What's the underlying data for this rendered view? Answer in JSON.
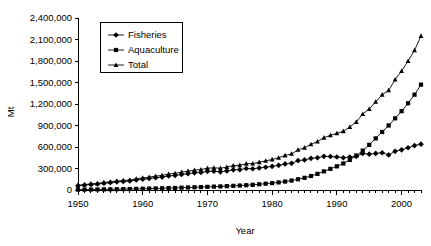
{
  "chart_data": {
    "type": "line",
    "title": "",
    "xlabel": "Year",
    "ylabel": "Mt",
    "xlim": [
      1950,
      2003
    ],
    "ylim": [
      0,
      2400000
    ],
    "grid": false,
    "legend_position": "top-left",
    "x_tick_labels": [
      "1950",
      "1960",
      "1970",
      "1980",
      "1990",
      "2000"
    ],
    "x_ticks": [
      1950,
      1960,
      1970,
      1980,
      1990,
      2000
    ],
    "y_tick_labels": [
      "0",
      "300,000",
      "600,000",
      "900,000",
      "1,200,000",
      "1,500,000",
      "1,800,000",
      "2,100,000",
      "2,400,000"
    ],
    "y_ticks": [
      0,
      300000,
      600000,
      900000,
      1200000,
      1500000,
      1800000,
      2100000,
      2400000
    ],
    "x": [
      1950,
      1951,
      1952,
      1953,
      1954,
      1955,
      1956,
      1957,
      1958,
      1959,
      1960,
      1961,
      1962,
      1963,
      1964,
      1965,
      1966,
      1967,
      1968,
      1969,
      1970,
      1971,
      1972,
      1973,
      1974,
      1975,
      1976,
      1977,
      1978,
      1979,
      1980,
      1981,
      1982,
      1983,
      1984,
      1985,
      1986,
      1987,
      1988,
      1989,
      1990,
      1991,
      1992,
      1993,
      1994,
      1995,
      1996,
      1997,
      1998,
      1999,
      2000,
      2001,
      2002,
      2003
    ],
    "series": [
      {
        "name": "Fisheries",
        "marker": "diamond",
        "values": [
          60000,
          70000,
          78000,
          84000,
          95000,
          104000,
          114000,
          120000,
          126000,
          140000,
          150000,
          160000,
          172000,
          180000,
          196000,
          204000,
          216000,
          228000,
          240000,
          244000,
          260000,
          262000,
          254000,
          266000,
          282000,
          284000,
          300000,
          296000,
          308000,
          318000,
          330000,
          344000,
          364000,
          372000,
          410000,
          420000,
          442000,
          450000,
          470000,
          468000,
          460000,
          450000,
          460000,
          470000,
          510000,
          500000,
          510000,
          520000,
          490000,
          540000,
          560000,
          590000,
          620000,
          640000
        ]
      },
      {
        "name": "Aquaculture",
        "marker": "square",
        "values": [
          5000,
          6000,
          7000,
          8000,
          9000,
          10000,
          11000,
          13000,
          14000,
          16000,
          18000,
          20000,
          22000,
          24000,
          27000,
          29000,
          32000,
          35000,
          38000,
          41000,
          44000,
          47000,
          50000,
          54000,
          58000,
          62000,
          67000,
          72000,
          80000,
          88000,
          96000,
          106000,
          118000,
          132000,
          150000,
          170000,
          195000,
          225000,
          260000,
          295000,
          330000,
          370000,
          420000,
          480000,
          550000,
          630000,
          720000,
          810000,
          900000,
          1000000,
          1100000,
          1210000,
          1330000,
          1470000
        ]
      },
      {
        "name": "Total",
        "marker": "triangle",
        "values": [
          65000,
          76000,
          85000,
          92000,
          104000,
          114000,
          125000,
          133000,
          140000,
          156000,
          168000,
          180000,
          194000,
          204000,
          223000,
          233000,
          248000,
          263000,
          278000,
          285000,
          304000,
          309000,
          304000,
          320000,
          340000,
          346000,
          367000,
          368000,
          388000,
          406000,
          426000,
          450000,
          482000,
          504000,
          560000,
          590000,
          637000,
          675000,
          730000,
          763000,
          790000,
          820000,
          880000,
          950000,
          1060000,
          1130000,
          1230000,
          1330000,
          1390000,
          1540000,
          1660000,
          1800000,
          1950000,
          2150000
        ]
      }
    ]
  },
  "legend": {
    "entries": [
      {
        "label": "Fisheries"
      },
      {
        "label": "Aquaculture"
      },
      {
        "label": "Total"
      }
    ]
  },
  "axes": {
    "x_axis_title": "Year",
    "y_axis_title": "Mt"
  }
}
